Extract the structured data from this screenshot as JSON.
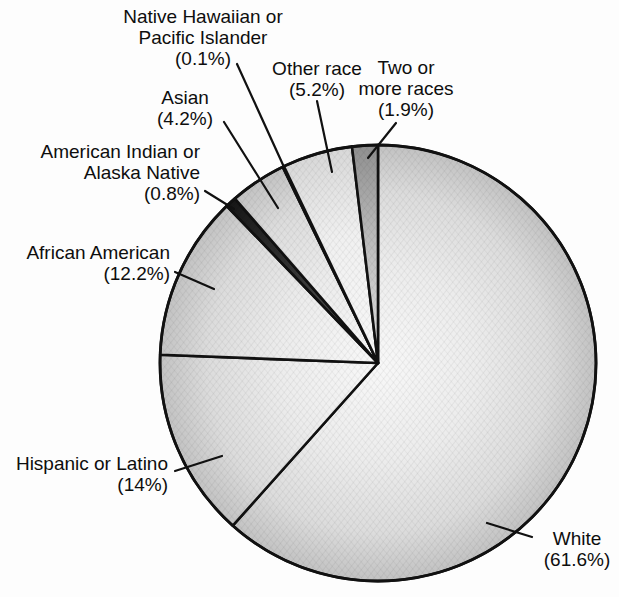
{
  "chart_data": {
    "type": "pie",
    "title": "",
    "unit": "percent",
    "start_angle": "12-oclock",
    "direction": "clockwise",
    "total": 100,
    "slices": [
      {
        "name": "White",
        "value": 61.6,
        "shade": "light",
        "label_lines": [
          "White",
          "(61.6%)"
        ]
      },
      {
        "name": "Hispanic or Latino",
        "value": 14,
        "shade": "light",
        "label_lines": [
          "Hispanic or Latino",
          "(14%)"
        ]
      },
      {
        "name": "African American",
        "value": 12.2,
        "shade": "light",
        "label_lines": [
          "African American",
          "(12.2%)"
        ]
      },
      {
        "name": "American Indian or Alaska Native",
        "value": 0.8,
        "shade": "black",
        "label_lines": [
          "American Indian or",
          "Alaska Native",
          "(0.8%)"
        ]
      },
      {
        "name": "Asian",
        "value": 4.2,
        "shade": "light",
        "label_lines": [
          "Asian",
          "(4.2%)"
        ]
      },
      {
        "name": "Native Hawaiian or Pacific Islander",
        "value": 0.1,
        "shade": "hairline",
        "label_lines": [
          "Native Hawaiian or",
          "Pacific Islander",
          "(0.1%)"
        ]
      },
      {
        "name": "Other race",
        "value": 5.2,
        "shade": "lighter",
        "label_lines": [
          "Other race",
          "(5.2%)"
        ]
      },
      {
        "name": "Two or more races",
        "value": 1.9,
        "shade": "dark",
        "label_lines": [
          "Two or",
          "more races",
          "(1.9%)"
        ]
      }
    ]
  },
  "colors": {
    "ink": "#111111",
    "background": "#fdfdfd",
    "pie_center": "#f8f8f8",
    "pie_mid": "#ececec",
    "pie_outer": "#dcdcdc",
    "pie_rim": "#c2c2c2",
    "other_rim": "#d8d8d8",
    "two_center": "#e2e2e2",
    "two_mid": "#bdbdbd",
    "two_rim": "#8f8f8f",
    "dark_slice_center": "#5c5c5c",
    "dark_slice_rim": "#171717",
    "hairline_slice": "#141414"
  }
}
